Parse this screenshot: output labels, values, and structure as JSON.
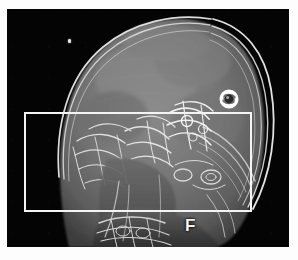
{
  "viewer": {
    "modality_view": "sagittal head scan",
    "background_color": "#fdfdfd",
    "canvas_color": "#040404"
  },
  "scan": {
    "alt_text": "Sagittal MRI of human head showing cranial vault, facial skeleton, skull base and upper cervical spine",
    "tissue_gray": "#6e6e6e",
    "bone_bright": "#e6e6e6"
  },
  "overlay": {
    "roi": {
      "label": "",
      "stroke_color": "#f4f4f4",
      "stroke_width_px": 2,
      "x": 17,
      "y": 103,
      "width": 228,
      "height": 100
    },
    "rotate_icon": {
      "name": "rotate-icon",
      "color": "#ffffff",
      "tooltip": "Rotate"
    },
    "orientation_marker": {
      "letter": "F",
      "meaning": "Feet",
      "color": "#f2f2f2"
    },
    "artifact": {
      "name": "bright-speck-artifact",
      "color": "#e8e8e8"
    }
  }
}
